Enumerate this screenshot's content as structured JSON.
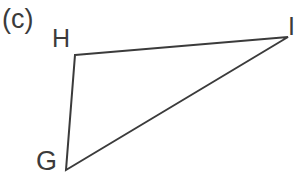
{
  "figure": {
    "part_label": "(c)",
    "shape_type": "triangle",
    "background_color": "#ffffff",
    "stroke_color": "#3b3b3b",
    "stroke_width": 2,
    "vertices": [
      {
        "name": "G",
        "label": "G",
        "x": 66,
        "y": 170
      },
      {
        "name": "H",
        "label": "H",
        "x": 75,
        "y": 55
      },
      {
        "name": "I",
        "label": "I",
        "x": 288,
        "y": 37
      }
    ],
    "edges": [
      {
        "name": "edge-h-i",
        "from": "H",
        "to": "I"
      },
      {
        "name": "edge-h-g",
        "from": "H",
        "to": "G"
      },
      {
        "name": "edge-g-i",
        "from": "G",
        "to": "I"
      }
    ],
    "polygon_points": "75,55 288,37 66,170"
  }
}
